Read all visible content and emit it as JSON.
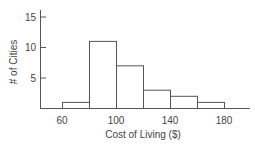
{
  "chart_data": {
    "type": "bar",
    "subtype": "histogram",
    "title": "",
    "xlabel": "Cost of Living ($)",
    "ylabel": "# of Cities",
    "bins": [
      {
        "start": 60,
        "end": 80,
        "value": 1,
        "hatched": false
      },
      {
        "start": 80,
        "end": 100,
        "value": 11,
        "hatched": true
      },
      {
        "start": 100,
        "end": 120,
        "value": 7,
        "hatched": false
      },
      {
        "start": 120,
        "end": 140,
        "value": 3,
        "hatched": false
      },
      {
        "start": 140,
        "end": 160,
        "value": 2,
        "hatched": false
      },
      {
        "start": 160,
        "end": 180,
        "value": 1,
        "hatched": false
      }
    ],
    "categories": [
      "60-80",
      "80-100",
      "100-120",
      "120-140",
      "140-160",
      "160-180"
    ],
    "values": [
      1,
      11,
      7,
      3,
      2,
      1
    ],
    "xticks": [
      60,
      100,
      140,
      180
    ],
    "yticks": [
      5,
      10,
      15
    ],
    "xlim": [
      45,
      195
    ],
    "ylim": [
      0,
      16
    ],
    "grid": false,
    "legend": "none"
  }
}
